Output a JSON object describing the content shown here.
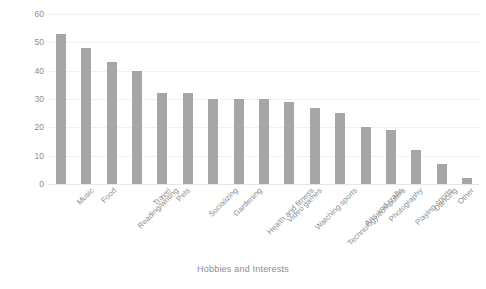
{
  "chart_data": {
    "type": "bar",
    "title": "",
    "xlabel": "Hobbies and Interests",
    "ylabel": "Percentage",
    "ylim": [
      0,
      60
    ],
    "yticks": [
      0,
      10,
      20,
      30,
      40,
      50,
      60
    ],
    "grid": true,
    "legend": false,
    "bar_color": "#a6a6a6",
    "categories": [
      "Music",
      "Food",
      "Reading/writing",
      "Travel",
      "Pets",
      "Socializing",
      "Gardening",
      "Health and fitness",
      "Video games",
      "Watching sports",
      "Technology/computers",
      "Arts and crafts",
      "Photography",
      "Playing sports",
      "Dancing",
      "Other",
      "Don't know"
    ],
    "values": [
      53,
      48,
      43,
      40,
      32,
      32,
      30,
      30,
      30,
      29,
      27,
      25,
      20,
      19,
      12,
      7,
      2
    ]
  },
  "axis": {
    "y_title": "Percentage",
    "x_title": "Hobbies and Interests"
  }
}
